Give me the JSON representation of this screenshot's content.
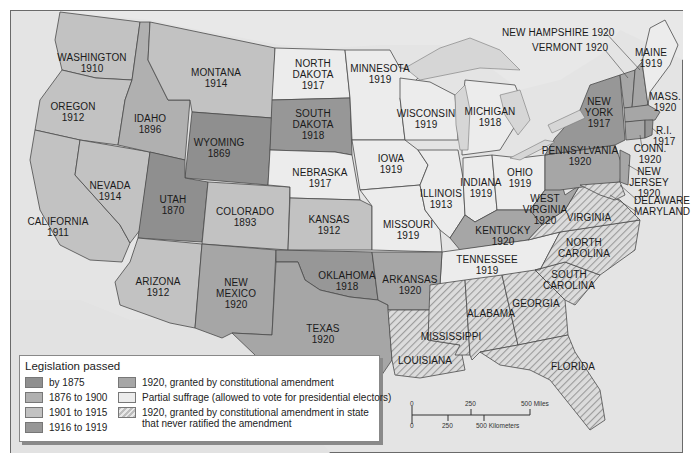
{
  "map": {
    "colors": {
      "background_water": "#e4e4e4",
      "by_1875": "#8f8f8f",
      "1876_to_1900": "#b0b0b0",
      "1901_to_1915": "#c2c2c2",
      "1916_to_1919": "#979797",
      "1920_amendment": "#a6a6a6",
      "partial_suffrage": "#ececec",
      "never_ratified": "hatched"
    },
    "states": {
      "washington": {
        "name": "WASHINGTON",
        "year": "1910"
      },
      "oregon": {
        "name": "OREGON",
        "year": "1912"
      },
      "idaho": {
        "name": "IDAHO",
        "year": "1896"
      },
      "montana": {
        "name": "MONTANA",
        "year": "1914"
      },
      "wyoming": {
        "name": "WYOMING",
        "year": "1869"
      },
      "north_dakota": {
        "name": "NORTH\nDAKOTA",
        "year": "1917"
      },
      "south_dakota": {
        "name": "SOUTH\nDAKOTA",
        "year": "1918"
      },
      "nebraska": {
        "name": "NEBRASKA",
        "year": "1917"
      },
      "minnesota": {
        "name": "MINNESOTA",
        "year": "1919"
      },
      "wisconsin": {
        "name": "WISCONSIN",
        "year": "1919"
      },
      "michigan": {
        "name": "MICHIGAN",
        "year": "1918"
      },
      "iowa": {
        "name": "IOWA",
        "year": "1919"
      },
      "illinois": {
        "name": "ILLINOIS",
        "year": "1913"
      },
      "indiana": {
        "name": "INDIANA",
        "year": "1919"
      },
      "ohio": {
        "name": "OHIO",
        "year": "1919"
      },
      "nevada": {
        "name": "NEVADA",
        "year": "1914"
      },
      "california": {
        "name": "CALIFORNIA",
        "year": "1911"
      },
      "utah": {
        "name": "UTAH",
        "year": "1870"
      },
      "colorado": {
        "name": "COLORADO",
        "year": "1893"
      },
      "kansas": {
        "name": "KANSAS",
        "year": "1912"
      },
      "missouri": {
        "name": "MISSOURI",
        "year": "1919"
      },
      "arizona": {
        "name": "ARIZONA",
        "year": "1912"
      },
      "new_mexico": {
        "name": "NEW\nMEXICO",
        "year": "1920"
      },
      "oklahoma": {
        "name": "OKLAHOMA",
        "year": "1918"
      },
      "texas": {
        "name": "TEXAS",
        "year": "1920"
      },
      "arkansas": {
        "name": "ARKANSAS",
        "year": "1920"
      },
      "kentucky": {
        "name": "KENTUCKY",
        "year": "1920"
      },
      "tennessee": {
        "name": "TENNESSEE",
        "year": "1919"
      },
      "west_virginia": {
        "name": "WEST\nVIRGINIA",
        "year": "1920"
      },
      "virginia": {
        "name": "VIRGINIA",
        "year": ""
      },
      "north_carolina": {
        "name": "NORTH\nCAROLINA",
        "year": ""
      },
      "south_carolina": {
        "name": "SOUTH\nCAROLINA",
        "year": ""
      },
      "georgia": {
        "name": "GEORGIA",
        "year": ""
      },
      "alabama": {
        "name": "ALABAMA",
        "year": ""
      },
      "mississippi": {
        "name": "MISSISSIPPI",
        "year": ""
      },
      "louisiana": {
        "name": "LOUISIANA",
        "year": ""
      },
      "florida": {
        "name": "FLORIDA",
        "year": ""
      },
      "pennsylvania": {
        "name": "PENNSYLVANIA",
        "year": "1920"
      },
      "new_york": {
        "name": "NEW\nYORK",
        "year": "1917"
      },
      "maine": {
        "name": "MAINE",
        "year": "1919"
      },
      "massachusetts": {
        "name": "MASS.",
        "year": "1920"
      },
      "rhode_island": {
        "name": "R.I.",
        "year": "1917"
      },
      "connecticut": {
        "name": "CONN.",
        "year": "1920"
      },
      "new_jersey": {
        "name": "NEW\nJERSEY",
        "year": "1920"
      },
      "delaware": {
        "name": "DELAWARE",
        "year": ""
      },
      "maryland": {
        "name": "MARYLAND",
        "year": ""
      },
      "new_hampshire": {
        "name": "NEW HAMPSHIRE 1920",
        "year": ""
      },
      "vermont": {
        "name": "VERMONT 1920",
        "year": ""
      }
    }
  },
  "legend": {
    "title": "Legislation passed",
    "items": [
      {
        "label": "by 1875",
        "color": "#8f8f8f"
      },
      {
        "label": "1876 to 1900",
        "color": "#b0b0b0"
      },
      {
        "label": "1901 to 1915",
        "color": "#c2c2c2"
      },
      {
        "label": "1916 to 1919",
        "color": "#979797"
      },
      {
        "label": "1920, granted by constitutional amendment",
        "color": "#a6a6a6"
      },
      {
        "label": "Partial suffrage (allowed to vote for presidential electors)",
        "color": "#ececec"
      },
      {
        "label": "1920, granted by constitutional amendment in state\nthat never ratified the amendment",
        "color": "hatched"
      }
    ]
  },
  "scale": {
    "miles": {
      "zero": "0",
      "mid": "250",
      "end": "500 Miles"
    },
    "kilometers": {
      "zero": "0",
      "mid": "250",
      "end": "500 Kilometers"
    }
  }
}
